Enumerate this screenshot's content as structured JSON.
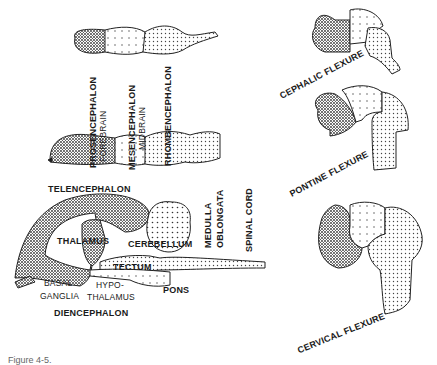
{
  "tube_labels": {
    "prosencephalon": "PROSENCEPHALON",
    "forebrain": "FOREBRAIN",
    "mesencephalon": "MESENCEPHALON",
    "midbrain": "MIDBRAIN",
    "rhombencephalon": "RHOMBENCEPHALON"
  },
  "adult_labels": {
    "telencephalon": "TELENCEPHALON",
    "thalamus": "THALAMUS",
    "cerebellum": "CEREBELLUM",
    "medulla": "MEDULLA",
    "oblongata": "OBLONGATA",
    "spinal_cord": "SPINAL CORD",
    "tectum": "TECTUM",
    "basal": "BASAL",
    "ganglia": "GANGLIA",
    "hypo": "HYPO-",
    "thalamus2": "THALAMUS",
    "pons": "PONS",
    "diencephalon": "DIENCEPHALON"
  },
  "flexures": {
    "cephalic": "CEPHALIC FLEXURE",
    "pontine": "PONTINE FLEXURE",
    "cervical": "CERVICAL FLEXURE"
  },
  "caption": "Figure 4-5."
}
